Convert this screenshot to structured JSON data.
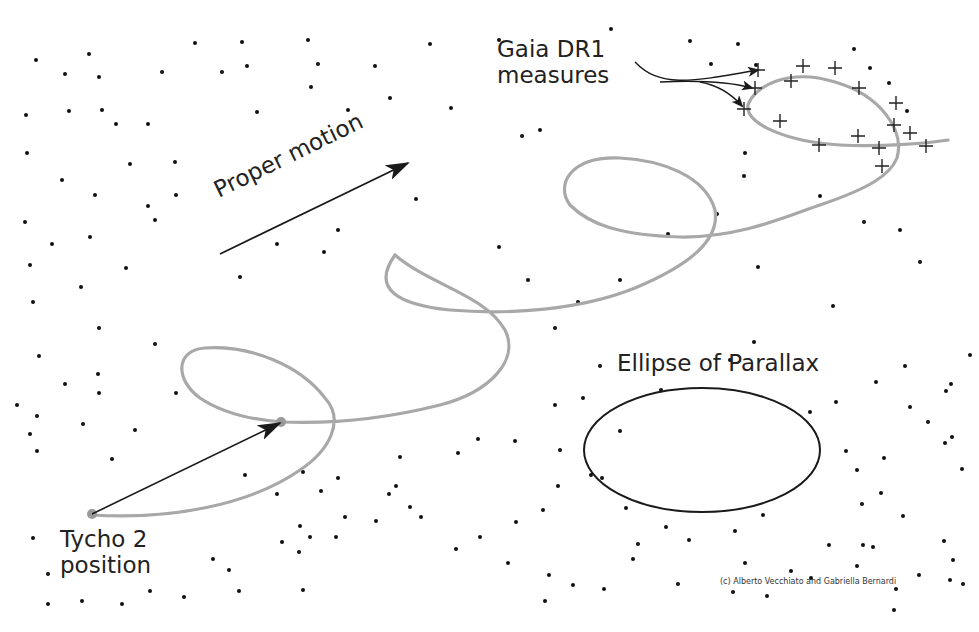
{
  "labels": {
    "gaia_line1": "Gaia DR1",
    "gaia_line2": "measures",
    "proper_motion": "Proper motion",
    "ellipse_of_parallax": "Ellipse of Parallax",
    "tycho_line1": "Tycho 2",
    "tycho_line2": "position",
    "credit": "(c) Alberto Vecchiato and Gabriella Bernardi"
  },
  "colors": {
    "background": "#ffffff",
    "stars": "#111111",
    "trajectory": "#a8a8a8",
    "arrows": "#1a1a1a",
    "ellipse": "#1a1a1a",
    "text": "#222222"
  },
  "stars": [
    [
      36,
      60
    ],
    [
      65,
      74
    ],
    [
      89,
      54
    ],
    [
      99,
      77
    ],
    [
      102,
      110
    ],
    [
      26,
      115
    ],
    [
      69,
      111
    ],
    [
      116,
      124
    ],
    [
      148,
      124
    ],
    [
      195,
      43
    ],
    [
      162,
      72
    ],
    [
      222,
      72
    ],
    [
      242,
      42
    ],
    [
      27,
      153
    ],
    [
      62,
      180
    ],
    [
      95,
      195
    ],
    [
      130,
      164
    ],
    [
      175,
      162
    ],
    [
      176,
      195
    ],
    [
      148,
      206
    ],
    [
      257,
      112
    ],
    [
      247,
      66
    ],
    [
      308,
      40
    ],
    [
      311,
      87
    ],
    [
      318,
      64
    ],
    [
      375,
      66
    ],
    [
      430,
      44
    ],
    [
      390,
      98
    ],
    [
      348,
      110
    ],
    [
      451,
      108
    ],
    [
      499,
      40
    ],
    [
      522,
      136
    ],
    [
      540,
      130
    ],
    [
      611,
      29
    ],
    [
      690,
      41
    ],
    [
      738,
      44
    ],
    [
      756,
      65
    ],
    [
      711,
      64
    ],
    [
      854,
      49
    ],
    [
      889,
      83
    ],
    [
      745,
      153
    ],
    [
      870,
      68
    ],
    [
      907,
      111
    ],
    [
      25,
      222
    ],
    [
      52,
      244
    ],
    [
      90,
      237
    ],
    [
      30,
      265
    ],
    [
      81,
      287
    ],
    [
      33,
      302
    ],
    [
      99,
      328
    ],
    [
      39,
      356
    ],
    [
      65,
      384
    ],
    [
      98,
      374
    ],
    [
      155,
      220
    ],
    [
      126,
      268
    ],
    [
      155,
      344
    ],
    [
      99,
      393
    ],
    [
      17,
      405
    ],
    [
      37,
      416
    ],
    [
      176,
      393
    ],
    [
      240,
      277
    ],
    [
      277,
      244
    ],
    [
      324,
      252
    ],
    [
      338,
      230
    ],
    [
      416,
      199
    ],
    [
      499,
      247
    ],
    [
      528,
      280
    ],
    [
      578,
      302
    ],
    [
      555,
      328
    ],
    [
      620,
      280
    ],
    [
      668,
      234
    ],
    [
      717,
      214
    ],
    [
      661,
      390
    ],
    [
      758,
      267
    ],
    [
      744,
      176
    ],
    [
      820,
      196
    ],
    [
      864,
      222
    ],
    [
      900,
      230
    ],
    [
      920,
      262
    ],
    [
      833,
      306
    ],
    [
      754,
      342
    ],
    [
      730,
      360
    ],
    [
      600,
      366
    ],
    [
      583,
      398
    ],
    [
      620,
      431
    ],
    [
      555,
      405
    ],
    [
      458,
      453
    ],
    [
      400,
      457
    ],
    [
      338,
      478
    ],
    [
      396,
      486
    ],
    [
      321,
      491
    ],
    [
      478,
      439
    ],
    [
      515,
      441
    ],
    [
      560,
      450
    ],
    [
      558,
      486
    ],
    [
      591,
      475
    ],
    [
      602,
      478
    ],
    [
      543,
      510
    ],
    [
      516,
      522
    ],
    [
      626,
      508
    ],
    [
      638,
      544
    ],
    [
      735,
      531
    ],
    [
      857,
      470
    ],
    [
      884,
      458
    ],
    [
      881,
      493
    ],
    [
      862,
      504
    ],
    [
      952,
      437
    ],
    [
      962,
      469
    ],
    [
      903,
      516
    ],
    [
      944,
      541
    ],
    [
      873,
      547
    ],
    [
      857,
      566
    ],
    [
      791,
      571
    ],
    [
      666,
      527
    ],
    [
      689,
      540
    ],
    [
      763,
      515
    ],
    [
      953,
      560
    ],
    [
      987,
      520
    ],
    [
      836,
      402
    ],
    [
      810,
      412
    ],
    [
      846,
      451
    ],
    [
      910,
      407
    ],
    [
      928,
      422
    ],
    [
      945,
      443
    ],
    [
      876,
      382
    ],
    [
      951,
      384
    ],
    [
      970,
      355
    ],
    [
      905,
      366
    ],
    [
      946,
      391
    ],
    [
      30,
      434
    ],
    [
      37,
      451
    ],
    [
      83,
      424
    ],
    [
      135,
      430
    ],
    [
      112,
      459
    ],
    [
      245,
      475
    ],
    [
      277,
      494
    ],
    [
      303,
      472
    ],
    [
      300,
      526
    ],
    [
      310,
      537
    ],
    [
      345,
      517
    ],
    [
      33,
      538
    ],
    [
      48,
      574
    ],
    [
      82,
      601
    ],
    [
      48,
      604
    ],
    [
      122,
      604
    ],
    [
      150,
      591
    ],
    [
      184,
      597
    ],
    [
      239,
      591
    ],
    [
      213,
      559
    ],
    [
      229,
      570
    ],
    [
      303,
      590
    ],
    [
      282,
      542
    ],
    [
      299,
      552
    ],
    [
      336,
      537
    ],
    [
      376,
      521
    ],
    [
      421,
      517
    ],
    [
      410,
      507
    ],
    [
      389,
      494
    ],
    [
      480,
      537
    ],
    [
      456,
      549
    ],
    [
      508,
      563
    ],
    [
      545,
      601
    ],
    [
      549,
      575
    ],
    [
      573,
      585
    ],
    [
      633,
      559
    ],
    [
      604,
      589
    ],
    [
      678,
      584
    ],
    [
      745,
      563
    ],
    [
      733,
      592
    ],
    [
      811,
      578
    ],
    [
      896,
      589
    ],
    [
      894,
      610
    ],
    [
      963,
      584
    ],
    [
      767,
      596
    ],
    [
      829,
      545
    ],
    [
      863,
      545
    ],
    [
      950,
      580
    ],
    [
      919,
      575
    ]
  ],
  "gaia_measures": [
    [
      758,
      70
    ],
    [
      803,
      66
    ],
    [
      835,
      68
    ],
    [
      791,
      81
    ],
    [
      859,
      88
    ],
    [
      755,
      88
    ],
    [
      896,
      103
    ],
    [
      744,
      109
    ],
    [
      780,
      121
    ],
    [
      894,
      125
    ],
    [
      910,
      133
    ],
    [
      858,
      136
    ],
    [
      819,
      145
    ],
    [
      879,
      148
    ],
    [
      926,
      146
    ],
    [
      882,
      166
    ]
  ]
}
